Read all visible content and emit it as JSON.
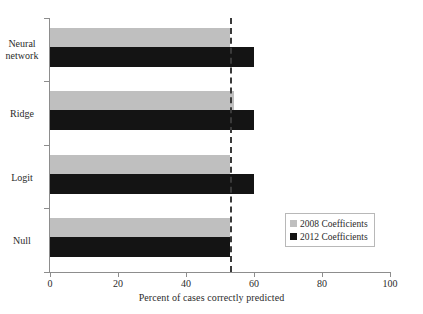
{
  "chart_data": {
    "type": "bar",
    "orientation": "horizontal",
    "title": "",
    "xlabel": "Percent of cases correctly predicted",
    "ylabel": "",
    "categories": [
      "Neural network",
      "Ridge",
      "Logit",
      "Null"
    ],
    "series": [
      {
        "name": "2008 Coefficients",
        "color": "#BFBFBF",
        "values": [
          53,
          54,
          53,
          53
        ]
      },
      {
        "name": "2012 Coefficients",
        "color": "#141414",
        "values": [
          60,
          60,
          60,
          53
        ]
      }
    ],
    "xlim": [
      0,
      100
    ],
    "xticks": [
      0,
      20,
      40,
      60,
      80,
      100
    ],
    "grid": false,
    "legend_position": "lower-right",
    "annotations": [
      {
        "type": "reference-line",
        "orientation": "vertical",
        "value": 53,
        "style": "dashed"
      }
    ]
  },
  "axis": {
    "x_tick_labels": [
      "0",
      "20",
      "40",
      "60",
      "80",
      "100"
    ],
    "x_title": "Percent of cases correctly predicted"
  },
  "categories": [
    {
      "label_line1": "Neural",
      "label_line2": "network"
    },
    {
      "label_line1": "Ridge",
      "label_line2": ""
    },
    {
      "label_line1": "Logit",
      "label_line2": ""
    },
    {
      "label_line1": "Null",
      "label_line2": ""
    }
  ],
  "legend": {
    "items": [
      {
        "label": "2008 Coefficients"
      },
      {
        "label": "2012 Coefficients"
      }
    ]
  }
}
